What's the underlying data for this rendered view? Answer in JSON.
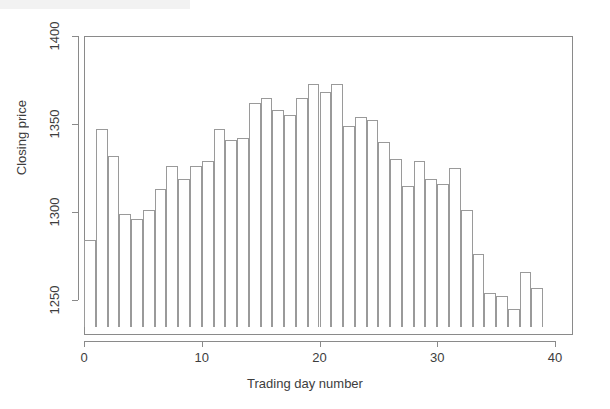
{
  "chart_data": {
    "type": "bar",
    "title": "",
    "subtitle": "",
    "xlabel": "Trading day number",
    "ylabel": "Closing price",
    "xlim": [
      0,
      40.5
    ],
    "ylim": [
      1240,
      1400
    ],
    "baseline": 1240,
    "grid": false,
    "legend": null,
    "x_ticks": [
      0,
      10,
      20,
      30,
      40
    ],
    "x_tick_labels": [
      "0",
      "10",
      "20",
      "30",
      "40"
    ],
    "y_ticks": [
      1250,
      1300,
      1350,
      1400
    ],
    "y_tick_labels": [
      "1250",
      "1300",
      "1350",
      "1400"
    ],
    "bar_fill": "#ffffff",
    "bar_border": "#9a9a9a",
    "axis_color": "#8a8a8a",
    "text_color": "#3d3d3d",
    "background": "#ffffff",
    "categories": [
      1,
      2,
      3,
      4,
      5,
      6,
      7,
      8,
      9,
      10,
      11,
      12,
      13,
      14,
      15,
      16,
      17,
      18,
      19,
      20,
      21,
      22,
      23,
      24,
      25,
      26,
      27,
      28,
      29,
      30,
      31,
      32,
      33,
      34,
      35,
      36,
      37,
      38,
      39
    ],
    "values": [
      1284,
      1347,
      1332,
      1299,
      1296,
      1301,
      1313,
      1326,
      1319,
      1326,
      1329,
      1347,
      1341,
      1342,
      1362,
      1365,
      1358,
      1355,
      1365,
      1373,
      1368,
      1373,
      1349,
      1354,
      1352,
      1340,
      1330,
      1315,
      1329,
      1319,
      1316,
      1325,
      1301,
      1276,
      1254,
      1252,
      1245,
      1266,
      1257
    ]
  },
  "axis": {
    "x_title": "Trading day number",
    "y_title": "Closing price"
  }
}
